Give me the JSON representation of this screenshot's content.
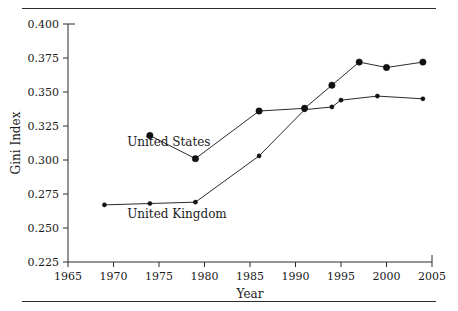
{
  "chart_data": {
    "type": "line",
    "title": "",
    "xlabel": "Year",
    "ylabel": "Gini Index",
    "xlim": [
      1965,
      2005
    ],
    "ylim": [
      0.225,
      0.4
    ],
    "grid": false,
    "legend_position": "inline-annotation",
    "xticks": [
      "1965",
      "1970",
      "1975",
      "1980",
      "1985",
      "1990",
      "1995",
      "2000",
      "2005"
    ],
    "xtick_values": [
      1965,
      1970,
      1975,
      1980,
      1985,
      1990,
      1995,
      2000,
      2005
    ],
    "yticks": [
      "0.225",
      "0.250",
      "0.275",
      "0.300",
      "0.325",
      "0.350",
      "0.375",
      "0.400"
    ],
    "ytick_values": [
      0.225,
      0.25,
      0.275,
      0.3,
      0.325,
      0.35,
      0.375,
      0.4
    ],
    "series": [
      {
        "name": "United States",
        "color": "#1a1a1a",
        "marker": "circle",
        "x": [
          1974,
          1979,
          1986,
          1991,
          1994,
          1997,
          2000,
          2004
        ],
        "values": [
          0.318,
          0.301,
          0.336,
          0.338,
          0.355,
          0.372,
          0.368,
          0.372
        ]
      },
      {
        "name": "United Kingdom",
        "color": "#1a1a1a",
        "marker": "small-circle",
        "x": [
          1969,
          1974,
          1979,
          1986,
          1991,
          1994,
          1995,
          1999,
          2004
        ],
        "values": [
          0.267,
          0.268,
          0.269,
          0.303,
          0.337,
          0.339,
          0.344,
          0.347,
          0.345
        ]
      }
    ],
    "annotations": [
      {
        "text": "United States",
        "x": 1971.5,
        "y": 0.3105,
        "anchor": "start"
      },
      {
        "text": "United Kingdom",
        "x": 1971.5,
        "y": 0.2575,
        "anchor": "start"
      }
    ]
  }
}
